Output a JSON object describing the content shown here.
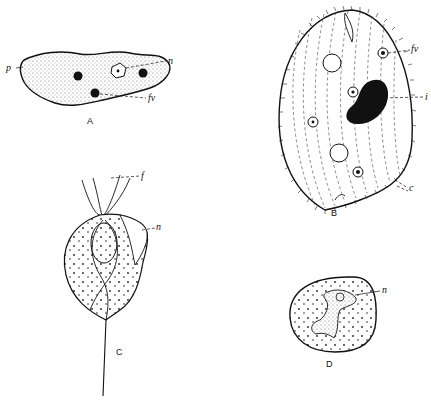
{
  "figure": {
    "panels": [
      {
        "id": "A",
        "caption": "A",
        "labels": {
          "p": "p",
          "n": "n",
          "fv": "fv"
        }
      },
      {
        "id": "B",
        "caption": "B",
        "labels": {
          "fv": "fv",
          "i": "i",
          "c": "c"
        }
      },
      {
        "id": "C",
        "caption": "C",
        "labels": {
          "f": "f",
          "n": "n"
        }
      },
      {
        "id": "D",
        "caption": "D",
        "labels": {
          "n": "n"
        }
      }
    ]
  }
}
